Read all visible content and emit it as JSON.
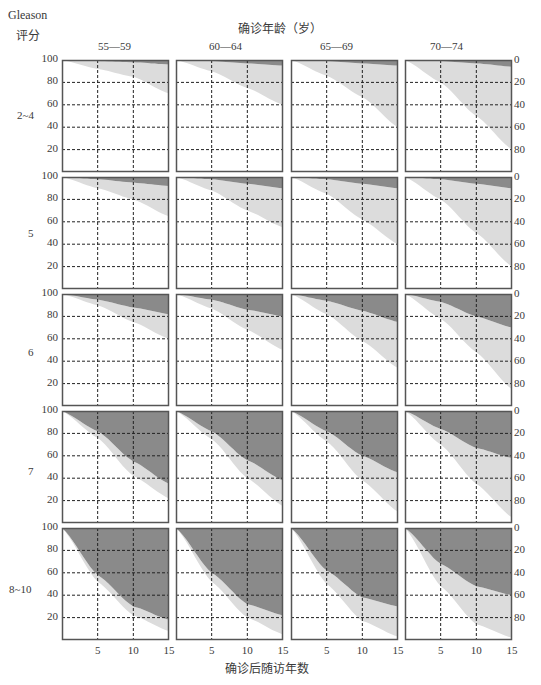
{
  "header": {
    "row_axis_title_line1": "Gleason",
    "row_axis_title_line2": "评分",
    "col_axis_title": "确诊年龄（岁）"
  },
  "footer": {
    "x_axis_title": "确诊后随访年数"
  },
  "colors": {
    "frame": "#555555",
    "grid": "#222222",
    "dark_band": "#8a8a8a",
    "light_band": "#dcdcdc",
    "background": "#ffffff"
  },
  "chart_data": {
    "type": "area",
    "title": "",
    "layout": "small-multiples 5 rows x 4 cols",
    "row_facet_label": "Gleason评分",
    "col_facet_label": "确诊年龄（岁）",
    "xlabel": "确诊后随访年数",
    "ylabel_left": "生存百分比 (100 top → 0 bottom)",
    "ylabel_right": "累计死亡百分比 (0 top → 100 bottom)",
    "xlim": [
      0,
      15
    ],
    "ylim": [
      0,
      100
    ],
    "x_ticks": [
      "5",
      "10",
      "15"
    ],
    "y_ticks_left": [
      "100",
      "80",
      "60",
      "40",
      "20"
    ],
    "y_ticks_right": [
      "0",
      "20",
      "40",
      "60",
      "80"
    ],
    "grid": "dashed, at x=5,10 and y=20,40,60,80",
    "columns": [
      "55—59",
      "60—64",
      "65—69",
      "70—74"
    ],
    "rows": [
      "2~4",
      "5",
      "6",
      "7",
      "8~10"
    ],
    "series_legend": [
      {
        "name": "前列腺癌死亡 (cumulative, dark band from top)"
      },
      {
        "name": "其他原因死亡 (cumulative, light band below dark)"
      }
    ],
    "x": [
      0,
      5,
      10,
      15
    ],
    "panels": [
      [
        {
          "col": "55—59",
          "dark": [
            0,
            1,
            2,
            4
          ],
          "total": [
            0,
            8,
            15,
            30
          ]
        },
        {
          "col": "60—64",
          "dark": [
            0,
            1,
            3,
            5
          ],
          "total": [
            0,
            10,
            25,
            40
          ]
        },
        {
          "col": "65—69",
          "dark": [
            0,
            1,
            3,
            5
          ],
          "total": [
            0,
            14,
            33,
            60
          ]
        },
        {
          "col": "70—74",
          "dark": [
            0,
            1,
            3,
            6
          ],
          "total": [
            0,
            20,
            50,
            80
          ]
        }
      ],
      [
        {
          "col": "55—59",
          "dark": [
            0,
            2,
            5,
            8
          ],
          "total": [
            0,
            10,
            20,
            35
          ]
        },
        {
          "col": "60—64",
          "dark": [
            0,
            2,
            6,
            10
          ],
          "total": [
            0,
            12,
            30,
            45
          ]
        },
        {
          "col": "65—69",
          "dark": [
            0,
            2,
            6,
            10
          ],
          "total": [
            0,
            15,
            38,
            60
          ]
        },
        {
          "col": "70—74",
          "dark": [
            0,
            2,
            6,
            10
          ],
          "total": [
            0,
            20,
            50,
            80
          ]
        }
      ],
      [
        {
          "col": "55—59",
          "dark": [
            0,
            5,
            12,
            18
          ],
          "total": [
            0,
            10,
            25,
            40
          ]
        },
        {
          "col": "60—64",
          "dark": [
            0,
            5,
            14,
            20
          ],
          "total": [
            0,
            13,
            32,
            50
          ]
        },
        {
          "col": "65—69",
          "dark": [
            0,
            6,
            15,
            25
          ],
          "total": [
            0,
            18,
            42,
            66
          ]
        },
        {
          "col": "70—74",
          "dark": [
            0,
            7,
            20,
            30
          ],
          "total": [
            0,
            22,
            52,
            85
          ]
        }
      ],
      [
        {
          "col": "55—59",
          "dark": [
            0,
            18,
            45,
            65
          ],
          "total": [
            0,
            24,
            58,
            78
          ]
        },
        {
          "col": "60—64",
          "dark": [
            0,
            18,
            44,
            62
          ],
          "total": [
            0,
            25,
            60,
            85
          ]
        },
        {
          "col": "65—69",
          "dark": [
            0,
            18,
            40,
            55
          ],
          "total": [
            0,
            27,
            62,
            90
          ]
        },
        {
          "col": "70—74",
          "dark": [
            0,
            16,
            33,
            42
          ],
          "total": [
            0,
            30,
            65,
            95
          ]
        }
      ],
      [
        {
          "col": "55—59",
          "dark": [
            0,
            42,
            70,
            82
          ],
          "total": [
            0,
            48,
            78,
            92
          ]
        },
        {
          "col": "60—64",
          "dark": [
            0,
            40,
            68,
            78
          ],
          "total": [
            0,
            48,
            80,
            95
          ]
        },
        {
          "col": "65—69",
          "dark": [
            0,
            38,
            62,
            70
          ],
          "total": [
            0,
            50,
            83,
            97
          ]
        },
        {
          "col": "70—74",
          "dark": [
            0,
            32,
            52,
            60
          ],
          "total": [
            0,
            52,
            86,
            98
          ]
        }
      ]
    ]
  }
}
